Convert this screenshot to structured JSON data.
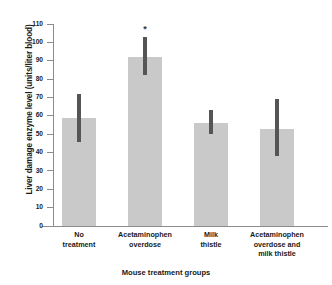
{
  "chart_data": {
    "type": "bar",
    "title": "",
    "xlabel": "Mouse treatment groups",
    "ylabel": "Liver damage enzyme level (units/liter blood)",
    "categories": [
      "No\ntreatment",
      "Acetaminophen\noverdose",
      "Milk\nthistle",
      "Acetaminophen\noverdose and\nmilk thistle"
    ],
    "category_lines": [
      [
        "No",
        "treatment"
      ],
      [
        "Acetaminophen",
        "overdose"
      ],
      [
        "Milk",
        "thistle"
      ],
      [
        "Acetaminophen",
        "overdose and",
        "milk thistle"
      ]
    ],
    "values": [
      59,
      92,
      56,
      53
    ],
    "error_low": [
      46,
      82,
      50,
      38
    ],
    "error_high": [
      72,
      103,
      63,
      69
    ],
    "annotations": [
      {
        "category_index": 1,
        "text": "*",
        "meaning": "significant difference"
      }
    ],
    "ylim": [
      0,
      110
    ],
    "ytick_step": 10,
    "yticks": [
      0,
      10,
      20,
      30,
      40,
      50,
      60,
      70,
      80,
      90,
      100,
      110
    ],
    "ytick_labels": [
      "0",
      "10",
      "20",
      "30",
      "40",
      "50",
      "60",
      "70",
      "80",
      "90",
      "100",
      "110"
    ],
    "grid": false,
    "legend": null,
    "bar_color": "#c9c9c9",
    "error_bar_color": "#555555",
    "axis_color": "#8c8c8c",
    "text_color": "#1a1a1a",
    "background": "#ffffff"
  }
}
